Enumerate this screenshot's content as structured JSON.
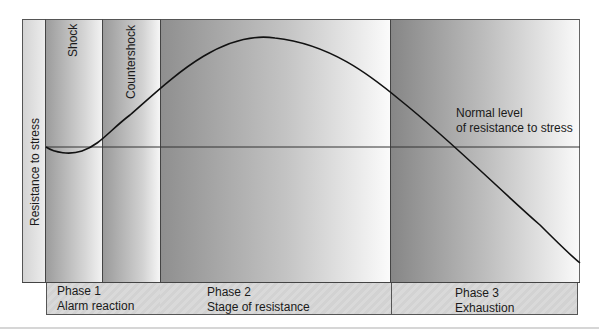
{
  "diagram": {
    "y_axis_label": "Resistance to stress",
    "subphase_labels": {
      "shock": "Shock",
      "countershock": "Countershock"
    },
    "normal_level_label": {
      "line1": "Normal level",
      "line2": "of resistance to stress"
    },
    "phases": [
      {
        "number_label": "Phase 1",
        "name": "Alarm reaction"
      },
      {
        "number_label": "Phase 2",
        "name": "Stage of resistance"
      },
      {
        "number_label": "Phase 3",
        "name": "Exhaustion"
      }
    ],
    "colors": {
      "curve": "#111111",
      "normal_line": "#333333",
      "band_dark": "#8f8f8f",
      "band_light": "#f8f8f8",
      "strip": "#d6d6d6"
    },
    "curve_description": "Resistance dips slightly below normal during shock, rises through countershock, peaks mid Phase 2, then declines below normal through Phase 3 exhaustion"
  }
}
